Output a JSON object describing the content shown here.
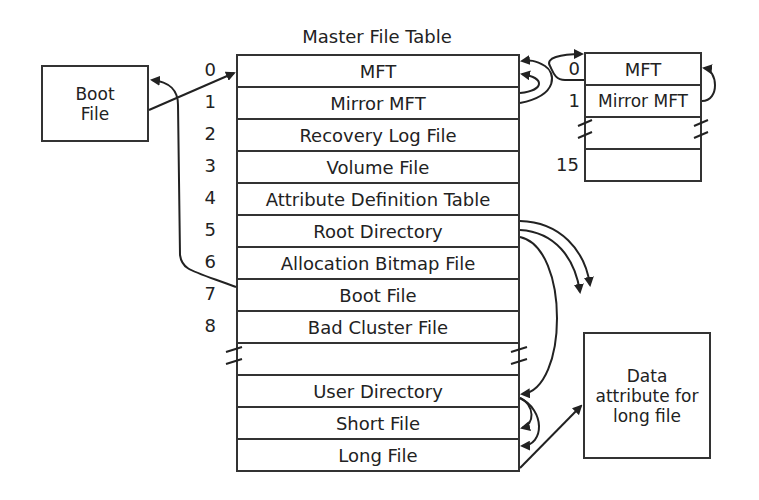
{
  "diagram": {
    "title": "Master File Table",
    "mft_rows": [
      {
        "index": "0",
        "label": "MFT"
      },
      {
        "index": "1",
        "label": "Mirror MFT"
      },
      {
        "index": "2",
        "label": "Recovery Log File"
      },
      {
        "index": "3",
        "label": "Volume File"
      },
      {
        "index": "4",
        "label": "Attribute Definition Table"
      },
      {
        "index": "5",
        "label": "Root Directory"
      },
      {
        "index": "6",
        "label": "Allocation Bitmap File"
      },
      {
        "index": "7",
        "label": "Boot File"
      },
      {
        "index": "8",
        "label": "Bad Cluster File"
      },
      {
        "index": "",
        "label": ""
      },
      {
        "index": "",
        "label": "User Directory"
      },
      {
        "index": "",
        "label": "Short File"
      },
      {
        "index": "",
        "label": "Long File"
      }
    ],
    "mirror_rows": [
      {
        "index": "0",
        "label": "MFT"
      },
      {
        "index": "1",
        "label": "Mirror MFT"
      },
      {
        "index": "",
        "label": ""
      },
      {
        "index": "15",
        "label": ""
      }
    ],
    "boot_box": {
      "line1": "Boot",
      "line2": "File"
    },
    "data_box": {
      "line1": "Data",
      "line2": "attribute for",
      "line3": "long file"
    }
  }
}
